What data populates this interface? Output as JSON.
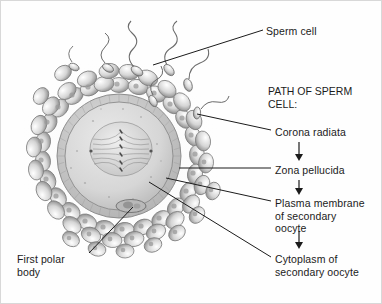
{
  "figure": {
    "kind": "biology-illustration",
    "background_color": "#fefefe",
    "border_color": "#d8d8d8",
    "ink_color": "#1b1b1b"
  },
  "labels": {
    "sperm_cell": "Sperm cell",
    "first_polar_body": "First polar\nbody",
    "corona_radiata": "Corona radiata",
    "zona_pellucida": "Zona pellucida",
    "plasma_membrane": "Plasma membrane\nof secondary\noocyte",
    "cytoplasm": "Cytoplasm of\nsecondary oocyte"
  },
  "path_list": {
    "header": "PATH OF SPERM\nCELL:",
    "steps": [
      "Corona radiata",
      "Zona pellucida",
      "Plasma membrane of secondary oocyte",
      "Cytoplasm of secondary oocyte"
    ],
    "arrow_glyph": "down-arrow"
  },
  "structures": {
    "oocyte_center_x": 118,
    "oocyte_center_y": 155,
    "zona_outer_radius": 62,
    "zona_inner_radius": 54,
    "spindle_label": "metaphase-spindle",
    "corona_cell_count": 54,
    "sperm_count": 7
  }
}
